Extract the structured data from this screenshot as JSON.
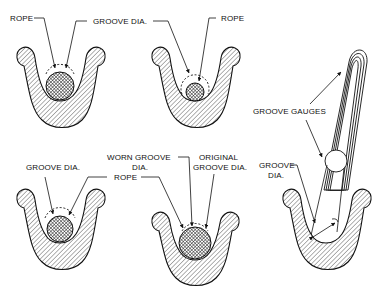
{
  "diagram": {
    "type": "technical-illustration",
    "panels": [
      {
        "id": "top-left",
        "description": "Rope correctly seated in groove",
        "labels": {
          "rope": "ROPE",
          "groove_dia": "GROOVE DIA."
        }
      },
      {
        "id": "top-middle",
        "description": "Groove too large for rope",
        "labels": {
          "rope": "ROPE"
        }
      },
      {
        "id": "bottom-left",
        "description": "Groove diameter vs rope",
        "labels": {
          "groove_dia": "GROOVE DIA.",
          "rope": "ROPE"
        }
      },
      {
        "id": "bottom-middle",
        "description": "Worn groove pinching rope",
        "labels": {
          "worn_groove_dia_line1": "WORN GROOVE",
          "worn_groove_dia_line2": "DIA.",
          "original_groove_dia_line1": "ORIGINAL",
          "original_groove_dia_line2": "GROOVE DIA.",
          "rope": "ROPE"
        }
      },
      {
        "id": "right",
        "description": "Checking groove with groove gauges",
        "labels": {
          "groove_gauges": "GROOVE GAUGES",
          "groove_dia_line1": "GROOVE",
          "groove_dia_line2": "DIA."
        }
      }
    ],
    "colors": {
      "ink": "#111111",
      "background": "#ffffff"
    }
  }
}
